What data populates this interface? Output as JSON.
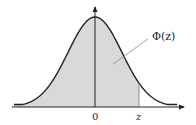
{
  "diagram": {
    "curve_label": "Φ(z)",
    "origin_label": "0",
    "z_label": "z",
    "colors": {
      "curve": "#222222",
      "axis": "#222222",
      "fill": "#d9d9d9",
      "leader": "#888888"
    }
  }
}
